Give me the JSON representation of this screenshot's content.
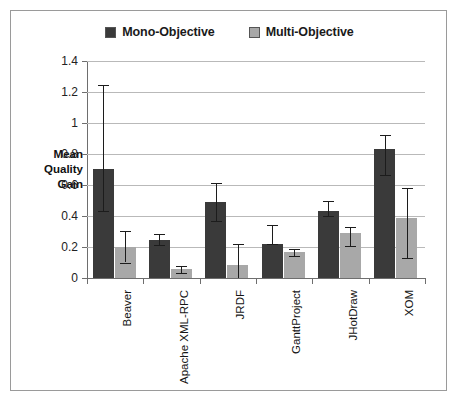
{
  "chart_data": {
    "type": "bar",
    "title": "",
    "subtitle": "",
    "xlabel": "",
    "ylabel": "Mean Quality Gain",
    "ylabel_lines": [
      "Mean",
      "Quality",
      "Gain"
    ],
    "ylim": [
      0,
      1.4
    ],
    "ytick_step": 0.2,
    "yticks": [
      0,
      0.2,
      0.4,
      0.6,
      0.8,
      1,
      1.2,
      1.4
    ],
    "ytick_labels": [
      "0",
      "0.2",
      "0.4",
      "0.6",
      "0.8",
      "1",
      "1.2",
      "1.4"
    ],
    "grid": true,
    "grid_axis": "y",
    "legend_position": "top-center",
    "categories": [
      "Beaver",
      "Apache XML-RPC",
      "JRDF",
      "GanttProject",
      "JHotDraw",
      "XOM"
    ],
    "series": [
      {
        "name": "Mono-Objective",
        "color": "#3a3a3a",
        "values": [
          0.705,
          0.245,
          0.49,
          0.22,
          0.435,
          0.83
        ],
        "err_low": [
          0.435,
          0.215,
          0.37,
          0.22,
          0.4,
          0.665
        ],
        "err_high": [
          1.245,
          0.285,
          0.61,
          0.34,
          0.5,
          0.92
        ]
      },
      {
        "name": "Multi-Objective",
        "color": "#a8a8a8",
        "values": [
          0.2,
          0.055,
          0.085,
          0.165,
          0.29,
          0.385
        ],
        "err_low": [
          0.1,
          0.035,
          0.0,
          0.145,
          0.205,
          0.13
        ],
        "err_high": [
          0.305,
          0.08,
          0.22,
          0.19,
          0.33,
          0.58
        ]
      }
    ]
  },
  "legend": {
    "items": [
      {
        "label": "Mono-Objective",
        "color": "#3a3a3a"
      },
      {
        "label": "Multi-Objective",
        "color": "#a8a8a8"
      }
    ]
  },
  "colors": {
    "mono": "#3a3a3a",
    "multi": "#a8a8a8",
    "grid": "#b9b9b9",
    "axis": "#6e6e6e",
    "frame": "#9a9a9a",
    "background": "#ffffff"
  }
}
